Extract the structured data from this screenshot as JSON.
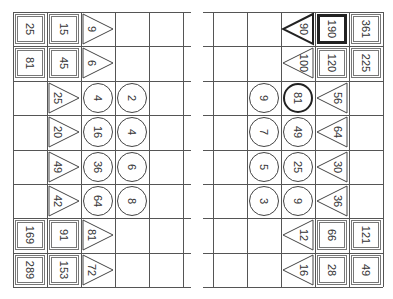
{
  "left_grid": {
    "rows": [
      [
        {
          "shape": "square",
          "value": "25"
        },
        {
          "shape": "square",
          "value": "15"
        },
        {
          "shape": "triangle-right",
          "value": "9"
        },
        {
          "shape": "empty",
          "value": ""
        },
        {
          "shape": "empty",
          "value": ""
        }
      ],
      [
        {
          "shape": "square",
          "value": "81"
        },
        {
          "shape": "square",
          "value": "45"
        },
        {
          "shape": "triangle-right",
          "value": "6"
        },
        {
          "shape": "empty",
          "value": ""
        },
        {
          "shape": "empty",
          "value": ""
        }
      ],
      [
        {
          "shape": "empty",
          "value": ""
        },
        {
          "shape": "triangle-right",
          "value": "25"
        },
        {
          "shape": "circle",
          "value": "4"
        },
        {
          "shape": "circle",
          "value": "2"
        },
        {
          "shape": "empty",
          "value": ""
        }
      ],
      [
        {
          "shape": "empty",
          "value": ""
        },
        {
          "shape": "triangle-right",
          "value": "20"
        },
        {
          "shape": "circle",
          "value": "16"
        },
        {
          "shape": "circle",
          "value": "4"
        },
        {
          "shape": "empty",
          "value": ""
        }
      ],
      [
        {
          "shape": "empty",
          "value": ""
        },
        {
          "shape": "triangle-right",
          "value": "49"
        },
        {
          "shape": "circle",
          "value": "36"
        },
        {
          "shape": "circle",
          "value": "6"
        },
        {
          "shape": "empty",
          "value": ""
        }
      ],
      [
        {
          "shape": "empty",
          "value": ""
        },
        {
          "shape": "triangle-right",
          "value": "42"
        },
        {
          "shape": "circle",
          "value": "64"
        },
        {
          "shape": "circle",
          "value": "8"
        },
        {
          "shape": "empty",
          "value": ""
        }
      ],
      [
        {
          "shape": "square",
          "value": "169"
        },
        {
          "shape": "square",
          "value": "91"
        },
        {
          "shape": "triangle-right",
          "value": "81"
        },
        {
          "shape": "empty",
          "value": ""
        },
        {
          "shape": "empty",
          "value": ""
        }
      ],
      [
        {
          "shape": "square",
          "value": "289"
        },
        {
          "shape": "square",
          "value": "153"
        },
        {
          "shape": "triangle-right",
          "value": "72"
        },
        {
          "shape": "empty",
          "value": ""
        },
        {
          "shape": "empty",
          "value": ""
        }
      ]
    ]
  },
  "right_grid": {
    "rows": [
      [
        {
          "shape": "empty",
          "value": ""
        },
        {
          "shape": "empty",
          "value": ""
        },
        {
          "shape": "triangle-left",
          "value": "90",
          "bold": true
        },
        {
          "shape": "square",
          "value": "190",
          "bold": true
        },
        {
          "shape": "square",
          "value": "361"
        }
      ],
      [
        {
          "shape": "empty",
          "value": ""
        },
        {
          "shape": "empty",
          "value": ""
        },
        {
          "shape": "triangle-left",
          "value": "100"
        },
        {
          "shape": "square",
          "value": "120"
        },
        {
          "shape": "square",
          "value": "225"
        }
      ],
      [
        {
          "shape": "empty",
          "value": ""
        },
        {
          "shape": "circle",
          "value": "9"
        },
        {
          "shape": "circle",
          "value": "81",
          "bold": true
        },
        {
          "shape": "triangle-left",
          "value": "56"
        },
        {
          "shape": "empty",
          "value": ""
        }
      ],
      [
        {
          "shape": "empty",
          "value": ""
        },
        {
          "shape": "circle",
          "value": "7"
        },
        {
          "shape": "circle",
          "value": "49"
        },
        {
          "shape": "triangle-left",
          "value": "64"
        },
        {
          "shape": "empty",
          "value": ""
        }
      ],
      [
        {
          "shape": "empty",
          "value": ""
        },
        {
          "shape": "circle",
          "value": "5"
        },
        {
          "shape": "circle",
          "value": "25"
        },
        {
          "shape": "triangle-left",
          "value": "30"
        },
        {
          "shape": "empty",
          "value": ""
        }
      ],
      [
        {
          "shape": "empty",
          "value": ""
        },
        {
          "shape": "circle",
          "value": "3"
        },
        {
          "shape": "circle",
          "value": "9"
        },
        {
          "shape": "triangle-left",
          "value": "36"
        },
        {
          "shape": "empty",
          "value": ""
        }
      ],
      [
        {
          "shape": "empty",
          "value": ""
        },
        {
          "shape": "empty",
          "value": ""
        },
        {
          "shape": "triangle-left",
          "value": "12"
        },
        {
          "shape": "square",
          "value": "66"
        },
        {
          "shape": "square",
          "value": "121"
        }
      ],
      [
        {
          "shape": "empty",
          "value": ""
        },
        {
          "shape": "empty",
          "value": ""
        },
        {
          "shape": "triangle-left",
          "value": "16"
        },
        {
          "shape": "square",
          "value": "28"
        },
        {
          "shape": "square",
          "value": "49"
        }
      ]
    ]
  },
  "colors": {
    "line": "#555555",
    "stroke": "#444444",
    "bold_stroke": "#222222",
    "text": "#333333"
  }
}
